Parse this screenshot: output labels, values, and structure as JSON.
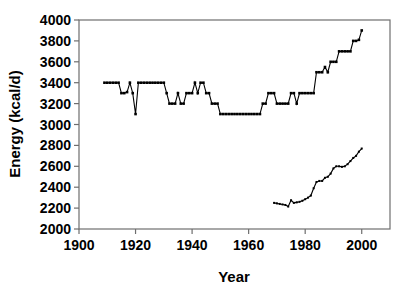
{
  "chart_data": {
    "type": "line",
    "title": "",
    "xlabel": "Year",
    "ylabel": "Energy (kcal/d)",
    "xlim": [
      1900,
      2010
    ],
    "ylim": [
      2000,
      4000
    ],
    "xticks": [
      1900,
      1920,
      1940,
      1960,
      1980,
      2000
    ],
    "xtick_labels": [
      "1900",
      "1920",
      "1940",
      "1960",
      "1980",
      "2000"
    ],
    "yticks": [
      2000,
      2200,
      2400,
      2600,
      2800,
      3000,
      3200,
      3400,
      3600,
      3800,
      4000
    ],
    "ytick_labels": [
      "2000",
      "2200",
      "2400",
      "2600",
      "2800",
      "3000",
      "3200",
      "3400",
      "3600",
      "3800",
      "4000"
    ],
    "grid": false,
    "legend": "none",
    "marker": "square",
    "line_color": "#000000",
    "frame_color": "#6e6e6e",
    "series": [
      {
        "name": "Food energy supply",
        "x": [
          1909,
          1910,
          1911,
          1912,
          1913,
          1914,
          1915,
          1916,
          1917,
          1918,
          1919,
          1920,
          1921,
          1922,
          1923,
          1924,
          1925,
          1926,
          1927,
          1928,
          1929,
          1930,
          1931,
          1932,
          1933,
          1934,
          1935,
          1936,
          1937,
          1938,
          1939,
          1940,
          1941,
          1942,
          1943,
          1944,
          1945,
          1946,
          1947,
          1948,
          1949,
          1950,
          1951,
          1952,
          1953,
          1954,
          1955,
          1956,
          1957,
          1958,
          1959,
          1960,
          1961,
          1962,
          1963,
          1964,
          1965,
          1966,
          1967,
          1968,
          1969,
          1970,
          1971,
          1972,
          1973,
          1974,
          1975,
          1976,
          1977,
          1978,
          1979,
          1980,
          1981,
          1982,
          1983,
          1984,
          1985,
          1986,
          1987,
          1988,
          1989,
          1990,
          1991,
          1992,
          1993,
          1994,
          1995,
          1996,
          1997,
          1998,
          1999,
          2000
        ],
        "y": [
          3400,
          3400,
          3400,
          3400,
          3400,
          3400,
          3300,
          3300,
          3310,
          3400,
          3300,
          3100,
          3400,
          3400,
          3400,
          3400,
          3400,
          3400,
          3400,
          3400,
          3400,
          3400,
          3300,
          3200,
          3200,
          3200,
          3300,
          3200,
          3200,
          3300,
          3300,
          3300,
          3400,
          3300,
          3400,
          3400,
          3300,
          3300,
          3200,
          3200,
          3200,
          3100,
          3100,
          3100,
          3100,
          3100,
          3100,
          3100,
          3100,
          3100,
          3100,
          3100,
          3100,
          3100,
          3100,
          3100,
          3200,
          3200,
          3300,
          3300,
          3300,
          3200,
          3200,
          3200,
          3200,
          3200,
          3300,
          3300,
          3200,
          3300,
          3300,
          3300,
          3300,
          3300,
          3300,
          3500,
          3500,
          3500,
          3550,
          3500,
          3600,
          3600,
          3600,
          3700,
          3700,
          3700,
          3700,
          3700,
          3800,
          3800,
          3810,
          3900
        ]
      },
      {
        "name": "Energy intake",
        "x": [
          1969,
          1970,
          1971,
          1972,
          1973,
          1974,
          1975,
          1976,
          1977,
          1978,
          1979,
          1980,
          1981,
          1982,
          1983,
          1984,
          1985,
          1986,
          1987,
          1988,
          1989,
          1990,
          1991,
          1992,
          1993,
          1994,
          1995,
          1996,
          1997,
          1998,
          1999,
          2000
        ],
        "y": [
          2250,
          2245,
          2240,
          2235,
          2230,
          2215,
          2275,
          2250,
          2255,
          2260,
          2270,
          2285,
          2300,
          2320,
          2390,
          2450,
          2460,
          2460,
          2490,
          2500,
          2530,
          2580,
          2600,
          2600,
          2595,
          2600,
          2620,
          2650,
          2680,
          2700,
          2740,
          2770
        ]
      }
    ]
  },
  "axis": {
    "x_title": "Year",
    "y_title": "Energy (kcal/d)"
  }
}
